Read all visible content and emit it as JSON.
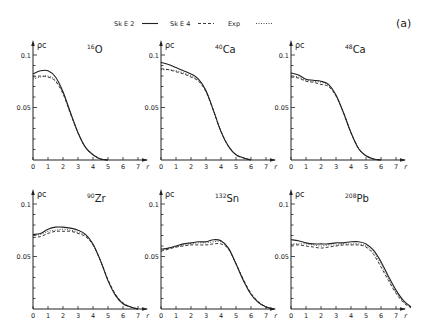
{
  "figure_label": "(a)",
  "legend": [
    {
      "name": "SkE2",
      "style": "solid"
    },
    {
      "name": "SkE4",
      "style": "dashed"
    },
    {
      "name": "Exp",
      "style": "dotted"
    }
  ],
  "axes": {
    "ylabel": "ρc",
    "xlabel": "r",
    "yticks": [
      "0.1",
      "0.05"
    ],
    "xticks": [
      "0",
      "1",
      "2",
      "3",
      "4",
      "5",
      "6",
      "7"
    ]
  },
  "chart_data": [
    {
      "type": "line",
      "title": "16O",
      "mass": "16",
      "element": "O",
      "xlabel": "r",
      "ylabel": "ρc",
      "xlim": [
        0,
        7.5
      ],
      "ylim": [
        0,
        0.11
      ],
      "x": [
        0,
        0.5,
        1,
        1.5,
        2,
        2.5,
        3,
        3.5,
        4,
        4.5,
        5
      ],
      "series": [
        {
          "name": "SkE2",
          "values": [
            0.082,
            0.085,
            0.085,
            0.079,
            0.065,
            0.045,
            0.026,
            0.012,
            0.005,
            0.001,
            0.0
          ]
        },
        {
          "name": "SkE4",
          "values": [
            0.079,
            0.08,
            0.079,
            0.075,
            0.063,
            0.044,
            0.026,
            0.012,
            0.005,
            0.001,
            0.0
          ]
        },
        {
          "name": "Exp",
          "values": [
            0.077,
            0.079,
            0.08,
            0.076,
            0.064,
            0.045,
            0.026,
            0.012,
            0.005,
            0.001,
            0.0
          ]
        }
      ]
    },
    {
      "type": "line",
      "title": "40Ca",
      "mass": "40",
      "element": "Ca",
      "xlabel": "r",
      "ylabel": "ρc",
      "xlim": [
        0,
        7.5
      ],
      "ylim": [
        0,
        0.11
      ],
      "x": [
        0,
        0.5,
        1,
        1.5,
        2,
        2.5,
        3,
        3.5,
        4,
        4.5,
        5,
        5.5,
        6
      ],
      "series": [
        {
          "name": "SkE2",
          "values": [
            0.093,
            0.091,
            0.088,
            0.085,
            0.082,
            0.077,
            0.066,
            0.047,
            0.027,
            0.013,
            0.005,
            0.002,
            0.0
          ]
        },
        {
          "name": "SkE4",
          "values": [
            0.087,
            0.086,
            0.084,
            0.082,
            0.079,
            0.075,
            0.065,
            0.047,
            0.027,
            0.013,
            0.005,
            0.002,
            0.0
          ]
        },
        {
          "name": "Exp",
          "values": [
            0.086,
            0.086,
            0.085,
            0.083,
            0.08,
            0.076,
            0.066,
            0.047,
            0.027,
            0.013,
            0.005,
            0.002,
            0.0
          ]
        }
      ]
    },
    {
      "type": "line",
      "title": "48Ca",
      "mass": "48",
      "element": "Ca",
      "xlabel": "r",
      "ylabel": "ρc",
      "xlim": [
        0,
        7.5
      ],
      "ylim": [
        0,
        0.11
      ],
      "x": [
        0,
        0.5,
        1,
        1.5,
        2,
        2.5,
        3,
        3.5,
        4,
        4.5,
        5,
        5.5,
        6
      ],
      "series": [
        {
          "name": "SkE2",
          "values": [
            0.083,
            0.081,
            0.077,
            0.076,
            0.075,
            0.072,
            0.062,
            0.045,
            0.026,
            0.011,
            0.004,
            0.001,
            0.0
          ]
        },
        {
          "name": "SkE4",
          "values": [
            0.079,
            0.078,
            0.075,
            0.074,
            0.072,
            0.07,
            0.061,
            0.045,
            0.026,
            0.011,
            0.004,
            0.001,
            0.0
          ]
        },
        {
          "name": "Exp",
          "values": [
            0.08,
            0.079,
            0.076,
            0.075,
            0.074,
            0.071,
            0.061,
            0.045,
            0.026,
            0.011,
            0.004,
            0.001,
            0.0
          ]
        }
      ]
    },
    {
      "type": "line",
      "title": "90Zr",
      "mass": "90",
      "element": "Zr",
      "xlabel": "r",
      "ylabel": "ρc",
      "xlim": [
        0,
        7.5
      ],
      "ylim": [
        0,
        0.11
      ],
      "x": [
        0,
        0.5,
        1,
        1.5,
        2,
        2.5,
        3,
        3.5,
        4,
        4.5,
        5,
        5.5,
        6,
        6.5,
        7
      ],
      "series": [
        {
          "name": "SkE2",
          "values": [
            0.071,
            0.072,
            0.076,
            0.078,
            0.078,
            0.077,
            0.075,
            0.071,
            0.062,
            0.046,
            0.027,
            0.013,
            0.005,
            0.002,
            0.0
          ]
        },
        {
          "name": "SkE4",
          "values": [
            0.068,
            0.069,
            0.072,
            0.074,
            0.074,
            0.074,
            0.072,
            0.069,
            0.061,
            0.046,
            0.028,
            0.014,
            0.006,
            0.002,
            0.0
          ]
        },
        {
          "name": "Exp",
          "values": [
            0.07,
            0.071,
            0.074,
            0.075,
            0.076,
            0.075,
            0.073,
            0.07,
            0.061,
            0.046,
            0.027,
            0.013,
            0.005,
            0.002,
            0.0
          ]
        }
      ]
    },
    {
      "type": "line",
      "title": "132Sn",
      "mass": "132",
      "element": "Sn",
      "xlabel": "r",
      "ylabel": "ρc",
      "xlim": [
        0,
        7.5
      ],
      "ylim": [
        0,
        0.11
      ],
      "x": [
        0,
        0.5,
        1,
        1.5,
        2,
        2.5,
        3,
        3.5,
        4,
        4.5,
        5,
        5.5,
        6,
        6.5,
        7,
        7.5
      ],
      "series": [
        {
          "name": "SkE2",
          "values": [
            0.057,
            0.058,
            0.06,
            0.062,
            0.063,
            0.064,
            0.064,
            0.066,
            0.065,
            0.058,
            0.043,
            0.027,
            0.014,
            0.006,
            0.002,
            0.0
          ]
        },
        {
          "name": "SkE4",
          "values": [
            0.055,
            0.057,
            0.059,
            0.06,
            0.061,
            0.061,
            0.061,
            0.062,
            0.062,
            0.057,
            0.043,
            0.028,
            0.015,
            0.007,
            0.002,
            0.0
          ]
        },
        {
          "name": "Exp",
          "values": [
            0.056,
            0.058,
            0.059,
            0.061,
            0.062,
            0.063,
            0.063,
            0.064,
            0.064,
            0.057,
            0.043,
            0.027,
            0.014,
            0.006,
            0.002,
            0.0
          ]
        }
      ]
    },
    {
      "type": "line",
      "title": "208Pb",
      "mass": "208",
      "element": "Pb",
      "xlabel": "r",
      "ylabel": "ρc",
      "xlim": [
        0,
        8
      ],
      "ylim": [
        0,
        0.11
      ],
      "x": [
        0,
        0.5,
        1,
        1.5,
        2,
        2.5,
        3,
        3.5,
        4,
        4.5,
        5,
        5.5,
        6,
        6.5,
        7,
        7.5,
        8
      ],
      "series": [
        {
          "name": "SkE2",
          "values": [
            0.066,
            0.065,
            0.063,
            0.062,
            0.062,
            0.062,
            0.063,
            0.063,
            0.064,
            0.064,
            0.062,
            0.056,
            0.045,
            0.031,
            0.018,
            0.008,
            0.002
          ]
        },
        {
          "name": "SkE4",
          "values": [
            0.061,
            0.061,
            0.06,
            0.059,
            0.058,
            0.059,
            0.06,
            0.061,
            0.061,
            0.061,
            0.059,
            0.052,
            0.04,
            0.027,
            0.015,
            0.006,
            0.001
          ]
        },
        {
          "name": "Exp",
          "values": [
            0.062,
            0.062,
            0.062,
            0.061,
            0.06,
            0.061,
            0.061,
            0.062,
            0.062,
            0.062,
            0.06,
            0.054,
            0.043,
            0.029,
            0.016,
            0.007,
            0.001
          ]
        }
      ]
    }
  ]
}
